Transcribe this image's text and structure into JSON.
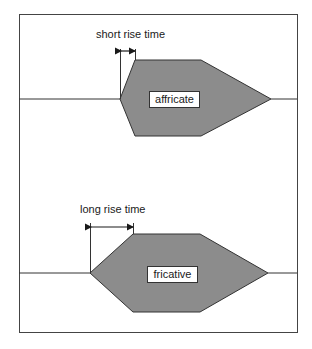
{
  "diagram": {
    "title": "",
    "colors": {
      "shape_fill": "#8c8c8c",
      "stroke": "#333333",
      "background": "#ffffff"
    },
    "panels": [
      {
        "name": "affricate",
        "annotation": "short rise time",
        "label": "affricate"
      },
      {
        "name": "fricative",
        "annotation": "long rise time",
        "label": "fricative"
      }
    ]
  }
}
